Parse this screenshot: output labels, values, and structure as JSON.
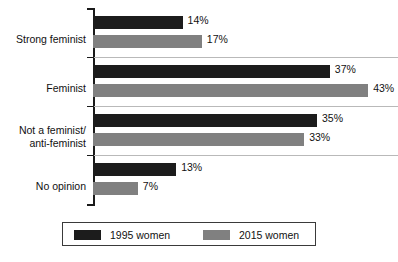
{
  "chart_data": {
    "type": "bar",
    "orientation": "horizontal",
    "title": "",
    "subtitle": "",
    "xlabel": "",
    "ylabel": "",
    "xlim": [
      0,
      45
    ],
    "grid": true,
    "legend_position": "bottom",
    "categories": [
      "Strong feminist",
      "Feminist",
      "Not a feminist/\nanti-feminist",
      "No opinion"
    ],
    "category_lines": [
      [
        "Strong feminist"
      ],
      [
        "Feminist"
      ],
      [
        "Not a feminist/",
        "anti-feminist"
      ],
      [
        "No opinion"
      ]
    ],
    "series": [
      {
        "name": "1995 women",
        "color": "#1c1c1c",
        "values": [
          14,
          37,
          35,
          13
        ],
        "labels": [
          "14%",
          "37%",
          "35%",
          "13%"
        ]
      },
      {
        "name": "2015 women",
        "color": "#808080",
        "values": [
          17,
          43,
          33,
          7
        ],
        "labels": [
          "17%",
          "43%",
          "33%",
          "7%"
        ]
      }
    ],
    "value_suffix": "%"
  },
  "legend": {
    "entries": [
      {
        "label": "1995 women",
        "color": "#1c1c1c"
      },
      {
        "label": "2015 women",
        "color": "#808080"
      }
    ]
  },
  "axis": {
    "category_labels": [
      {
        "line1": "Strong feminist",
        "line2": ""
      },
      {
        "line1": "Feminist",
        "line2": ""
      },
      {
        "line1": "Not a feminist/",
        "line2": "anti-feminist"
      },
      {
        "line1": "No opinion",
        "line2": ""
      }
    ]
  },
  "colors": {
    "series_1995": "#1c1c1c",
    "series_2015": "#808080",
    "axis": "#1a1a1a",
    "gridline": "#b9b9b9",
    "legend_border": "#3a3a3a",
    "text": "#111111",
    "background": "#ffffff"
  }
}
